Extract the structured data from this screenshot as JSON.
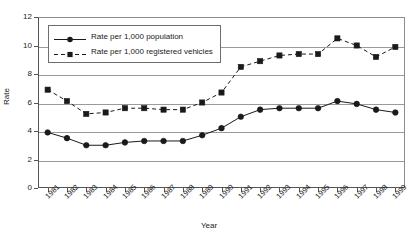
{
  "chart_data": {
    "type": "line",
    "title": "",
    "xlabel": "Year",
    "ylabel": "Rate",
    "ylim": [
      0,
      12
    ],
    "ytick_step": 2,
    "yticks": [
      "0",
      "2",
      "4",
      "6",
      "8",
      "10",
      "12"
    ],
    "grid": true,
    "legend_position": "top-left-inside",
    "categories": [
      "1981",
      "1982",
      "1983",
      "1984",
      "1985",
      "1986",
      "1987",
      "1988",
      "1989",
      "1990",
      "1991",
      "1992",
      "1993",
      "1994",
      "1995",
      "1996",
      "1997",
      "1998",
      "1999"
    ],
    "series": [
      {
        "name": "Rate per 1,000 population",
        "marker": "circle",
        "linestyle": "solid",
        "color": "#1a1a1a",
        "values": [
          3.9,
          3.5,
          3.0,
          3.0,
          3.2,
          3.3,
          3.3,
          3.3,
          3.7,
          4.2,
          5.0,
          5.5,
          5.6,
          5.6,
          5.6,
          6.1,
          5.9,
          5.5,
          5.3
        ]
      },
      {
        "name": "Rate per 1,000 registered vehicles",
        "marker": "square",
        "linestyle": "dashed",
        "color": "#1a1a1a",
        "values": [
          6.9,
          6.1,
          5.2,
          5.3,
          5.6,
          5.6,
          5.5,
          5.5,
          6.0,
          6.7,
          8.5,
          8.9,
          9.3,
          9.4,
          9.4,
          10.5,
          10.0,
          9.2,
          9.9
        ]
      }
    ]
  },
  "axis": {
    "x_title": "Year",
    "y_title": "Rate"
  },
  "legend": {
    "items": [
      {
        "label": "Rate per 1,000 population"
      },
      {
        "label": "Rate per 1,000 registered vehicles"
      }
    ]
  }
}
